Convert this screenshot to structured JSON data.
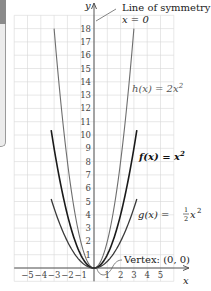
{
  "chart_data": {
    "type": "line",
    "title": "",
    "xlabel": "x",
    "ylabel": "y",
    "xlim": [
      -6,
      6
    ],
    "ylim": [
      -1,
      19
    ],
    "grid": true,
    "x_ticks": [
      "−5",
      "−4",
      "−3",
      "−2",
      "−1",
      "1",
      "2",
      "3",
      "4",
      "5"
    ],
    "y_ticks": [
      "1",
      "2",
      "3",
      "4",
      "5",
      "6",
      "7",
      "8",
      "9",
      "10",
      "11",
      "12",
      "13",
      "14",
      "15",
      "16",
      "17",
      "18"
    ],
    "series": [
      {
        "name": "h(x) = 2x²",
        "formula": "2x^2",
        "domain": [
          -3,
          3
        ],
        "color": "#6e6e6e"
      },
      {
        "name": "f(x) = x²",
        "formula": "x^2",
        "domain": [
          -3.22,
          3.22
        ],
        "color": "#1a1a1a"
      },
      {
        "name": "g(x) = ½x²",
        "formula": "0.5x^2",
        "domain": [
          -3.22,
          3.22
        ],
        "color": "#3a3a3a"
      }
    ],
    "annotations": [
      {
        "text": "Line of symmetry:",
        "sub": "x = 0"
      },
      {
        "text": "Vertex: (0, 0)"
      }
    ]
  },
  "labels": {
    "y_axis": "y",
    "x_axis": "x",
    "symmetry_line1": "Line of symmetry:",
    "symmetry_line2": "x = 0",
    "h_label": "h(x) = 2x",
    "h_exp": "2",
    "f_label": "f(x) = x",
    "f_exp": "2",
    "g_label_pre": "g(x) = ",
    "g_frac_num": "1",
    "g_frac_den": "2",
    "g_label_post": "x",
    "g_exp": "2",
    "vertex": "Vertex: (0, 0)"
  },
  "colors": {
    "grid": "#d6d6d6",
    "axis": "#555555",
    "h": "#6e6e6e",
    "f": "#1a1a1a",
    "g": "#3a3a3a"
  }
}
